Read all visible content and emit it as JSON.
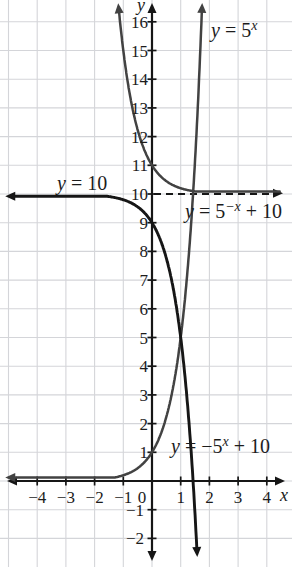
{
  "chart_data": {
    "type": "line",
    "title": "",
    "xlabel": "x",
    "ylabel": "y",
    "x_range": [
      -4,
      4
    ],
    "y_range": [
      -2,
      16
    ],
    "grid": true,
    "legend_position": "none",
    "x_ticks": [
      {
        "v": -4,
        "label": "−4"
      },
      {
        "v": -3,
        "label": "−3"
      },
      {
        "v": -2,
        "label": "−2"
      },
      {
        "v": -1,
        "label": "−1"
      },
      {
        "v": 0,
        "label": "0"
      },
      {
        "v": 1,
        "label": "1"
      },
      {
        "v": 2,
        "label": "2"
      },
      {
        "v": 3,
        "label": "3"
      },
      {
        "v": 4,
        "label": "4"
      }
    ],
    "y_ticks": [
      {
        "v": 16,
        "label": "16"
      },
      {
        "v": 15,
        "label": "15"
      },
      {
        "v": 14,
        "label": "14"
      },
      {
        "v": 13,
        "label": "13"
      },
      {
        "v": 12,
        "label": "12"
      },
      {
        "v": 11,
        "label": "11"
      },
      {
        "v": 10,
        "label": "10"
      },
      {
        "v": 9,
        "label": "9"
      },
      {
        "v": 8,
        "label": "8"
      },
      {
        "v": 7,
        "label": "7"
      },
      {
        "v": 6,
        "label": "6"
      },
      {
        "v": 5,
        "label": "5"
      },
      {
        "v": 4,
        "label": "4"
      },
      {
        "v": 3,
        "label": "3"
      },
      {
        "v": 2,
        "label": "2"
      },
      {
        "v": 1,
        "label": "1"
      },
      {
        "v": -1,
        "label": "−1"
      },
      {
        "v": -2,
        "label": "−2"
      }
    ],
    "series": [
      {
        "name": "y = 5^x",
        "a": 1,
        "base": 5,
        "c": 1,
        "offset": 0,
        "x_min": -4.8,
        "x_max": 1.736,
        "color": "#424242",
        "width": 2.5,
        "arrows": [
          "start",
          "end"
        ]
      },
      {
        "name": "y = 5^(-x) + 10",
        "a": 1,
        "base": 5,
        "c": -1,
        "offset": 10,
        "x_min": -1.147,
        "x_max": 4.45,
        "color": "#424242",
        "width": 2.5,
        "arrows": [
          "start"
        ]
      },
      {
        "name": "y = -5^x + 10",
        "a": -1,
        "base": 5,
        "c": 1,
        "offset": 10,
        "x_min": -4.8,
        "x_max": 1.561,
        "color": "#161616",
        "width": 2.9,
        "arrows": [
          "start",
          "end"
        ]
      }
    ],
    "asymptote": {
      "y": 10,
      "style": "dashed",
      "color": "#161616"
    },
    "annotations": [
      {
        "id": "label-5x",
        "color": "#565656",
        "parts": [
          {
            "t": "y",
            "it": true
          },
          {
            "t": " = 5"
          },
          {
            "t": "x",
            "sup": true,
            "it": true
          }
        ]
      },
      {
        "id": "label-y10",
        "color": "#444444",
        "parts": [
          {
            "t": "y",
            "it": true
          },
          {
            "t": " = 10"
          }
        ]
      },
      {
        "id": "label-5negx",
        "color": "#565656",
        "parts": [
          {
            "t": "y",
            "it": true
          },
          {
            "t": " = 5"
          },
          {
            "t": "−x",
            "sup": true,
            "it": true
          },
          {
            "t": " + 10"
          }
        ]
      },
      {
        "id": "label-neg5x",
        "color": "#3a3a3a",
        "parts": [
          {
            "t": "y",
            "it": true
          },
          {
            "t": " = −5"
          },
          {
            "t": "x",
            "sup": true,
            "it": true
          },
          {
            "t": " + 10"
          }
        ]
      }
    ],
    "colors": {
      "grid": "#d4d5d9",
      "axis": "#161616"
    }
  }
}
